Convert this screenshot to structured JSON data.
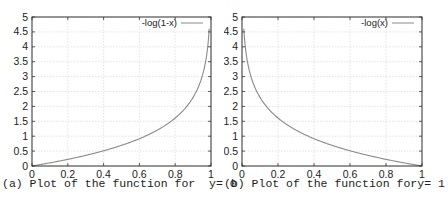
{
  "chart_data": [
    {
      "type": "line",
      "title": "",
      "xlabel": "",
      "ylabel": "",
      "xlim": [
        0,
        1
      ],
      "ylim": [
        0,
        5
      ],
      "xticks": [
        "0",
        "0.2",
        "0.4",
        "0.6",
        "0.8",
        "1"
      ],
      "yticks": [
        "0",
        "0.5",
        "1",
        "1.5",
        "2",
        "2.5",
        "3",
        "3.5",
        "4",
        "4.5",
        "5"
      ],
      "grid": true,
      "legend_position": "top-right",
      "series": [
        {
          "name": "-log(1-x)",
          "x": [
            0,
            0.1,
            0.2,
            0.3,
            0.4,
            0.5,
            0.6,
            0.7,
            0.8,
            0.9,
            0.95,
            0.98,
            0.99
          ],
          "y": [
            0,
            0.105,
            0.223,
            0.357,
            0.511,
            0.693,
            0.916,
            1.204,
            1.609,
            2.303,
            2.996,
            3.912,
            4.605
          ]
        }
      ],
      "caption": "(a) Plot of the function for  y= 0"
    },
    {
      "type": "line",
      "title": "",
      "xlabel": "",
      "ylabel": "",
      "xlim": [
        0,
        1
      ],
      "ylim": [
        0,
        5
      ],
      "xticks": [
        "0",
        "0.2",
        "0.4",
        "0.6",
        "0.8",
        "1"
      ],
      "yticks": [
        "0",
        "0.5",
        "1",
        "1.5",
        "2",
        "2.5",
        "3",
        "3.5",
        "4",
        "4.5",
        "5"
      ],
      "grid": true,
      "legend_position": "top-right",
      "series": [
        {
          "name": "-log(x)",
          "x": [
            0.01,
            0.02,
            0.05,
            0.1,
            0.2,
            0.3,
            0.4,
            0.5,
            0.6,
            0.7,
            0.8,
            0.9,
            1
          ],
          "y": [
            4.605,
            3.912,
            2.996,
            2.303,
            1.609,
            1.204,
            0.916,
            0.693,
            0.511,
            0.357,
            0.223,
            0.105,
            0
          ]
        }
      ],
      "caption": "(b) Plot of the function fory= 1"
    }
  ],
  "colors": {
    "line": "#8a8a8a",
    "frame": "#333333",
    "grid": "#d8d8d8",
    "text": "#222222"
  }
}
